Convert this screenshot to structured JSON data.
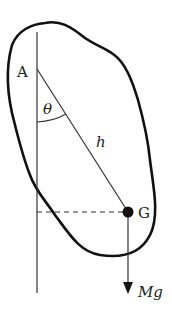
{
  "diagram": {
    "labels": {
      "pivot": "A",
      "center_of_mass": "G",
      "angle": "θ",
      "distance": "h",
      "weight": "Mg"
    },
    "colors": {
      "stroke": "#111111",
      "text": "#222222",
      "background": "#ffffff"
    }
  }
}
